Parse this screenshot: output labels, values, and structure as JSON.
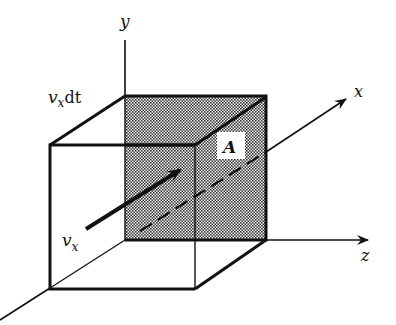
{
  "diagram": {
    "type": "3d-flux-box",
    "labels": {
      "axis_y": "y",
      "axis_x": "x",
      "axis_z": "z",
      "length_label_main": "v",
      "length_label_sub": "x",
      "length_label_suffix": "dt",
      "velocity_main": "v",
      "velocity_sub": "x",
      "area": "A"
    },
    "colors": {
      "stroke": "#111111",
      "shade_light": "#ffffff",
      "shade_dark": "#555555",
      "background": "#ffffff"
    }
  }
}
